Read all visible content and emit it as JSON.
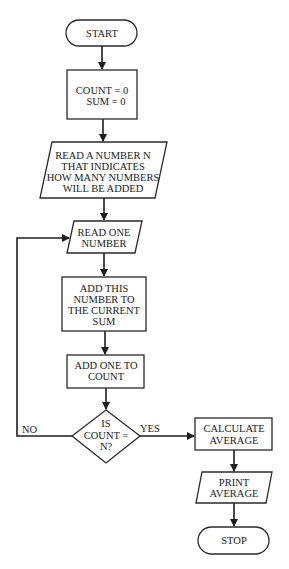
{
  "diagram": {
    "type": "flowchart",
    "nodes": {
      "start": {
        "kind": "terminal",
        "lines": [
          "START"
        ]
      },
      "init": {
        "kind": "process",
        "lines": [
          "COUNT = 0",
          "SUM = 0"
        ]
      },
      "read_n": {
        "kind": "input",
        "lines": [
          "READ A NUMBER N",
          "THAT INDICATES",
          "HOW MANY NUMBERS",
          "WILL BE ADDED"
        ]
      },
      "read_one": {
        "kind": "input",
        "lines": [
          "READ ONE",
          "NUMBER"
        ]
      },
      "add_sum": {
        "kind": "process",
        "lines": [
          "ADD THIS",
          "NUMBER TO",
          "THE CURRENT",
          "SUM"
        ]
      },
      "add_count": {
        "kind": "process",
        "lines": [
          "ADD ONE TO",
          "COUNT"
        ]
      },
      "decision": {
        "kind": "decision",
        "lines": [
          "IS",
          "COUNT =",
          "N?"
        ]
      },
      "calc_avg": {
        "kind": "process",
        "lines": [
          "CALCULATE",
          "AVERAGE"
        ]
      },
      "print_avg": {
        "kind": "output",
        "lines": [
          "PRINT",
          "AVERAGE"
        ]
      },
      "stop": {
        "kind": "terminal",
        "lines": [
          "STOP"
        ]
      }
    },
    "edges": {
      "yes_label": "YES",
      "no_label": "NO"
    },
    "colors": {
      "stroke": "#2a2a2a",
      "fill": "#ffffff",
      "text": "#222222"
    }
  }
}
